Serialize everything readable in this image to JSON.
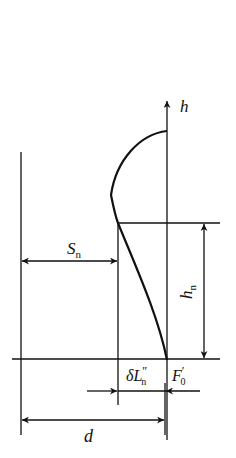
{
  "diagram": {
    "type": "geometric-optics-schematic",
    "labels": {
      "axis": "h",
      "S": {
        "main": "S",
        "sub": "n"
      },
      "h_n": {
        "main": "h",
        "sub": "n"
      },
      "delta_L": {
        "main": "δL",
        "sup": "″",
        "sub": "n"
      },
      "F0": {
        "main": "F",
        "sup": "′",
        "sub": "0"
      },
      "d": "d"
    },
    "colors": {
      "line": "#111111",
      "background": "#ffffff"
    }
  }
}
